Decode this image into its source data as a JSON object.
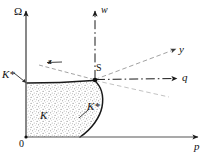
{
  "figure": {
    "background_color": "#ffffff",
    "line_color": "#1a1a1a",
    "stipple_color": "#8a8a8a",
    "axes": {
      "vertical": {
        "label": "Ω",
        "name": "omega-axis",
        "x": 26,
        "y_top": 8,
        "y_bottom": 137,
        "style": "solid-arrow"
      },
      "horizontal": {
        "label": "p",
        "name": "p-axis",
        "y": 137,
        "x_left": 26,
        "x_right": 200,
        "style": "solid-arrow"
      },
      "origin": {
        "label": "0",
        "x": 26,
        "y": 137
      }
    },
    "rays": [
      {
        "label": "w",
        "name": "w-ray",
        "style": "dash-dot",
        "from": [
          95,
          80
        ],
        "to": [
          95,
          9
        ]
      },
      {
        "label": "q",
        "name": "q-ray",
        "style": "dash-dot",
        "from": [
          95,
          80
        ],
        "to": [
          178,
          78
        ]
      },
      {
        "label": "y",
        "name": "y-ray",
        "style": "dashed",
        "from": [
          95,
          80
        ],
        "to": [
          176,
          50
        ]
      },
      {
        "label": "z",
        "name": "z-ray",
        "style": "dashed",
        "from": [
          95,
          80
        ],
        "to": [
          34,
          64
        ]
      },
      {
        "label": "",
        "name": "lower-dashed-ray",
        "style": "dashed",
        "from": [
          95,
          80
        ],
        "to": [
          168,
          97
        ]
      }
    ],
    "points": [
      {
        "label": "S",
        "name": "point-s",
        "x": 95,
        "y": 80
      }
    ],
    "regions": [
      {
        "label": "K",
        "name": "region-k",
        "description": "stippled cone region bounded left by Ω axis, below by p axis, right by curve K*"
      }
    ],
    "curve_labels": [
      {
        "label": "K*",
        "name": "k-star-curve-label",
        "x": 87,
        "y": 101
      },
      {
        "label": "K*",
        "name": "k-star-left-label",
        "x": 2,
        "y": 69
      }
    ]
  }
}
